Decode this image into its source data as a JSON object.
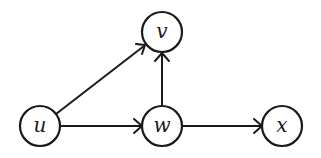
{
  "diagram": {
    "type": "directed-graph",
    "nodes": [
      {
        "id": "u",
        "label": "u",
        "cx": 40,
        "cy": 126
      },
      {
        "id": "v",
        "label": "v",
        "cx": 162,
        "cy": 32
      },
      {
        "id": "w",
        "label": "w",
        "cx": 162,
        "cy": 126
      },
      {
        "id": "x",
        "label": "x",
        "cx": 282,
        "cy": 126
      }
    ],
    "edges": [
      {
        "from": "u",
        "to": "v"
      },
      {
        "from": "u",
        "to": "w"
      },
      {
        "from": "w",
        "to": "v"
      },
      {
        "from": "w",
        "to": "x"
      }
    ],
    "colors": {
      "stroke": "#1a1a1a",
      "fill": "#ffffff",
      "background": "#ffffff"
    }
  }
}
